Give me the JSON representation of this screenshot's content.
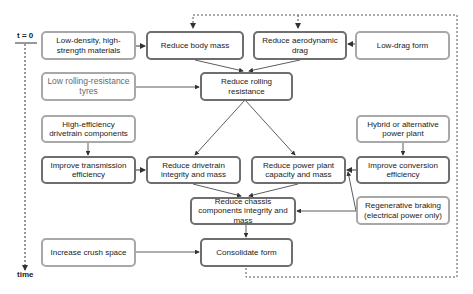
{
  "timeline": {
    "start_label": "t = 0",
    "end_label": "time"
  },
  "boxes": {
    "low_density": "Low-density, high-strength materials",
    "body_mass": "Reduce body mass",
    "aero_drag": "Reduce aerodynamic drag",
    "low_drag_form": "Low-drag form",
    "low_rr_tyres": "Low rolling-resistance tyres",
    "rolling_resistance": "Reduce rolling resistance",
    "high_eff_drivetrain": "High-efficiency drivetrain components",
    "hybrid": "Hybrid or alternative power plant",
    "transmission": "Improve transmission efficiency",
    "drivetrain": "Reduce drivetrain integrity and mass",
    "power_plant": "Reduce power plant capacity and mass",
    "conversion": "Improve conversion efficiency",
    "chassis": "Reduce chassis components integrity and mass",
    "regen_braking": "Regenerative braking (electrical power only)",
    "crush_space": "Increase crush space",
    "consolidate": "Consolidate form"
  },
  "colors": {
    "strong_border": "#6e6e6e",
    "light_border": "#a8a8a8",
    "arrow": "#333333"
  }
}
